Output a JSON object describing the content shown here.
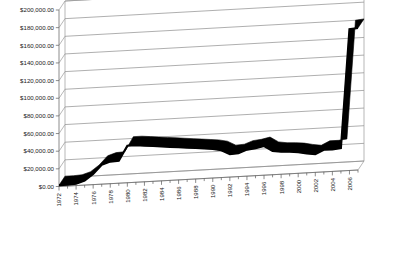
{
  "chart_data": {
    "type": "line",
    "title": "",
    "subtitle": "",
    "xlabel": "",
    "ylabel": "",
    "grid": true,
    "legend": false,
    "legend_position": "none",
    "render_style": "3d-perspective",
    "ylim": [
      0,
      200000
    ],
    "ytick_labels": [
      "$200,000.00",
      "$180,000.00",
      "$160,000.00",
      "$140,000.00",
      "$120,000.00",
      "$100,000.00",
      "$80,000.00",
      "$60,000.00",
      "$40,000.00",
      "$20,000.00",
      "$0.00"
    ],
    "ytick_values": [
      200000,
      180000,
      160000,
      140000,
      120000,
      100000,
      80000,
      60000,
      40000,
      20000,
      0
    ],
    "xtick_labels": [
      "1972",
      "1974",
      "1976",
      "1978",
      "1980",
      "1982",
      "1984",
      "1986",
      "1988",
      "1990",
      "1992",
      "1994",
      "1996",
      "1998",
      "2000",
      "2002",
      "2004",
      "2006"
    ],
    "x": [
      1972,
      1973,
      1974,
      1975,
      1976,
      1977,
      1978,
      1979,
      1980,
      1981,
      1982,
      1983,
      1984,
      1985,
      1986,
      1987,
      1988,
      1989,
      1990,
      1991,
      1992,
      1993,
      1994,
      1995,
      1996,
      1997,
      1998,
      1999,
      2000,
      2001,
      2002,
      2003,
      2004,
      2005,
      2006,
      2007
    ],
    "values": [
      1500,
      1500,
      2000,
      5000,
      12000,
      22000,
      25000,
      25500,
      42000,
      42000,
      41000,
      40000,
      39000,
      38000,
      37000,
      36000,
      35000,
      34000,
      33000,
      31000,
      26000,
      26500,
      30000,
      31000,
      33000,
      27000,
      25500,
      25000,
      24000,
      22000,
      20500,
      25000,
      25000,
      26000,
      160000,
      161000
    ],
    "series": [
      {
        "name": "Series 1",
        "color": "#000000",
        "values": [
          1500,
          1500,
          2000,
          5000,
          12000,
          22000,
          25000,
          25500,
          42000,
          42000,
          41000,
          40000,
          39000,
          38000,
          37000,
          36000,
          35000,
          34000,
          33000,
          31000,
          26000,
          26500,
          30000,
          31000,
          33000,
          27000,
          25500,
          25000,
          24000,
          22000,
          20500,
          25000,
          25000,
          26000,
          160000,
          161000
        ]
      }
    ],
    "annotations": []
  },
  "colors": {
    "series": "#000000",
    "gridline": "#8d8d8d",
    "axis": "#6f6f6f",
    "background": "#ffffff",
    "text": "#1a1a1a"
  }
}
